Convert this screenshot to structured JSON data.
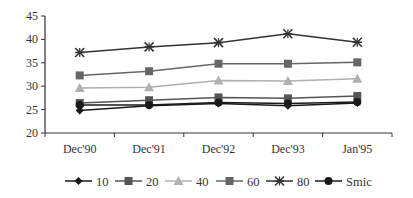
{
  "chart_data": {
    "type": "line",
    "title": "",
    "xlabel": "",
    "ylabel": "",
    "categories": [
      "Dec'90",
      "Dec'91",
      "Dec'92",
      "Dec'93",
      "Jan'95"
    ],
    "ylim": [
      20,
      45
    ],
    "yticks": [
      20,
      25,
      30,
      35,
      40,
      45
    ],
    "grid": false,
    "legend_position": "bottom",
    "series": [
      {
        "name": "10",
        "marker": "diamond",
        "color": "#1a1a1a",
        "values": [
          24.8,
          25.8,
          26.3,
          25.8,
          26.4
        ]
      },
      {
        "name": "20",
        "marker": "square",
        "color": "#555555",
        "values": [
          26.4,
          27.0,
          27.6,
          27.4,
          27.9
        ]
      },
      {
        "name": "40",
        "marker": "triangle",
        "color": "#b0b0b0",
        "values": [
          29.6,
          29.8,
          31.2,
          31.1,
          31.6
        ]
      },
      {
        "name": "60",
        "marker": "square",
        "color": "#666666",
        "values": [
          32.3,
          33.2,
          34.8,
          34.8,
          35.1
        ]
      },
      {
        "name": "80",
        "marker": "star",
        "color": "#333333",
        "values": [
          37.2,
          38.4,
          39.3,
          41.2,
          39.4
        ]
      },
      {
        "name": "Smic",
        "marker": "circle",
        "color": "#1a1a1a",
        "values": [
          26.0,
          26.0,
          26.5,
          26.3,
          26.6
        ]
      }
    ]
  }
}
